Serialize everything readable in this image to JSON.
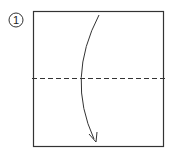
{
  "step": {
    "number": "1"
  },
  "diagram": {
    "paper": {
      "x": 33,
      "y": 11,
      "width": 130,
      "height": 135,
      "stroke": "#333333"
    },
    "fold_line": {
      "type": "valley",
      "y": 78,
      "x1": 33,
      "x2": 164,
      "stroke": "#333333"
    },
    "arrow": {
      "description": "fold top edge down to bottom edge",
      "start": [
        99,
        15
      ],
      "control": [
        70,
        78
      ],
      "end": [
        96,
        142
      ],
      "stroke": "#333333"
    }
  }
}
